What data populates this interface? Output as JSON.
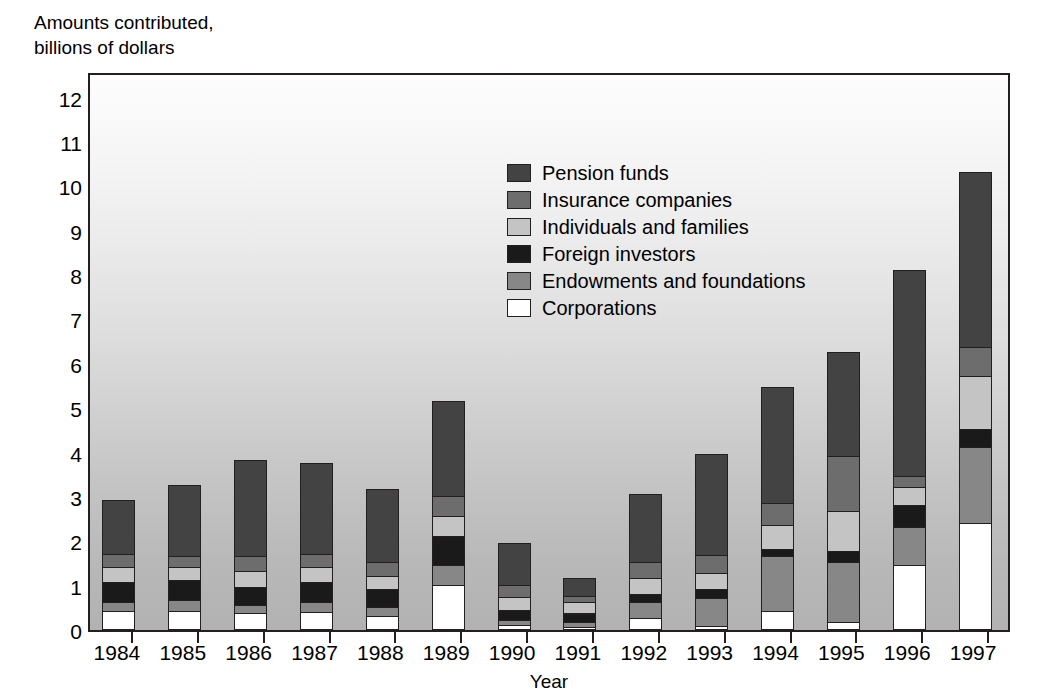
{
  "chart_data": {
    "type": "bar",
    "subtype": "stacked-vertical",
    "title": "",
    "ylabel": "Amounts contributed,\nbillions of dollars",
    "xlabel": "Year",
    "ylim": [
      0,
      12.6
    ],
    "yticks": [
      0,
      1,
      2,
      3,
      4,
      5,
      6,
      7,
      8,
      9,
      10,
      11,
      12
    ],
    "ytick_labels": [
      "0",
      "1",
      "2",
      "3",
      "4",
      "5",
      "6",
      "7",
      "8",
      "9",
      "10",
      "11",
      "12"
    ],
    "grid": false,
    "legend_position": "inside-top-center",
    "categories": [
      "1984",
      "1985",
      "1986",
      "1987",
      "1988",
      "1989",
      "1990",
      "1991",
      "1992",
      "1993",
      "1994",
      "1995",
      "1996",
      "1997"
    ],
    "stack_order_bottom_to_top": [
      "Corporations",
      "Endowments and foundations",
      "Foreign investors",
      "Individuals and families",
      "Insurance companies",
      "Pension funds"
    ],
    "series": [
      {
        "name": "Corporations",
        "color": "#ffffff",
        "values": [
          0.4,
          0.4,
          0.35,
          0.38,
          0.3,
          1.0,
          0.08,
          0.05,
          0.25,
          0.06,
          0.4,
          0.15,
          1.45,
          2.4
        ]
      },
      {
        "name": "Endowments and foundations",
        "color": "#878787",
        "values": [
          0.2,
          0.25,
          0.2,
          0.22,
          0.2,
          0.45,
          0.12,
          0.1,
          0.35,
          0.65,
          1.25,
          1.35,
          0.85,
          1.7
        ]
      },
      {
        "name": "Foreign investors",
        "color": "#1a1a1a",
        "values": [
          0.45,
          0.45,
          0.4,
          0.45,
          0.4,
          0.65,
          0.22,
          0.2,
          0.2,
          0.2,
          0.15,
          0.25,
          0.5,
          0.4
        ]
      },
      {
        "name": "Individuals and families",
        "color": "#c4c4c4",
        "values": [
          0.35,
          0.3,
          0.35,
          0.35,
          0.3,
          0.45,
          0.3,
          0.25,
          0.35,
          0.35,
          0.55,
          0.9,
          0.4,
          1.2
        ]
      },
      {
        "name": "Insurance companies",
        "color": "#6d6d6d",
        "values": [
          0.3,
          0.25,
          0.35,
          0.3,
          0.3,
          0.45,
          0.28,
          0.15,
          0.35,
          0.4,
          0.5,
          1.25,
          0.25,
          0.65
        ]
      },
      {
        "name": "Pension funds",
        "color": "#434343",
        "values": [
          1.2,
          1.6,
          2.15,
          2.05,
          1.65,
          2.15,
          0.95,
          0.4,
          1.55,
          2.29,
          2.6,
          2.35,
          4.65,
          3.95
        ]
      }
    ],
    "totals": [
      2.9,
      3.25,
      3.8,
      3.75,
      3.15,
      5.15,
      1.95,
      1.15,
      3.05,
      3.95,
      5.45,
      6.25,
      8.1,
      10.3
    ]
  },
  "legend": {
    "items": [
      {
        "label": "Pension funds",
        "color": "#434343"
      },
      {
        "label": "Insurance companies",
        "color": "#6d6d6d"
      },
      {
        "label": "Individuals and families",
        "color": "#c4c4c4"
      },
      {
        "label": "Foreign investors",
        "color": "#1a1a1a"
      },
      {
        "label": "Endowments and foundations",
        "color": "#878787"
      },
      {
        "label": "Corporations",
        "color": "#ffffff"
      }
    ]
  },
  "axes": {
    "y_title": "Amounts contributed,\nbillions of dollars",
    "x_title": "Year"
  }
}
